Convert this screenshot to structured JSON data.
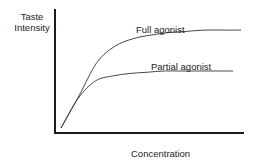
{
  "chart_data": {
    "type": "line",
    "title": "",
    "xlabel": "Concentration",
    "ylabel": "Taste Intensity",
    "ylabel_lines": [
      "Taste",
      "Intensity"
    ],
    "grid": false,
    "legend": "none (inline annotations)",
    "axis_ticks": "none",
    "xlim": [
      0,
      1
    ],
    "ylim": [
      0,
      1
    ],
    "series": [
      {
        "name": "Full agonist",
        "x": [
          0.0,
          0.1,
          0.2,
          0.3,
          0.4,
          0.5,
          0.6,
          0.7,
          0.8,
          0.9,
          1.0
        ],
        "values": [
          0.04,
          0.3,
          0.57,
          0.7,
          0.76,
          0.79,
          0.81,
          0.82,
          0.83,
          0.83,
          0.83
        ]
      },
      {
        "name": "Partial agonist",
        "x": [
          0.0,
          0.1,
          0.2,
          0.3,
          0.4,
          0.5,
          0.6,
          0.7,
          0.8,
          0.9,
          1.0
        ],
        "values": [
          0.04,
          0.28,
          0.42,
          0.46,
          0.48,
          0.49,
          0.5,
          0.5,
          0.5,
          0.5,
          0.5
        ]
      }
    ],
    "annotations": [
      {
        "text": "Full agonist",
        "near_series": "Full agonist"
      },
      {
        "text": "Partial agonist",
        "near_series": "Partial agonist"
      }
    ]
  },
  "colors": {
    "axis": "#1a1a1a",
    "curve": "#333333",
    "text": "#222222"
  }
}
